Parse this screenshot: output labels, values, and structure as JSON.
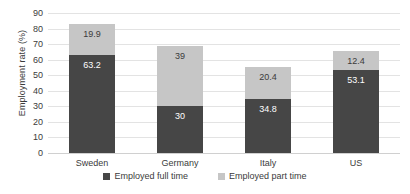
{
  "chart_data": {
    "type": "bar",
    "subtype": "stacked-bar",
    "title": "",
    "xlabel": "",
    "ylabel": "Employment rate (%)",
    "ylim": [
      0,
      90
    ],
    "ytick_step": 10,
    "yticks": [
      "90",
      "80",
      "70",
      "60",
      "50",
      "40",
      "30",
      "20",
      "10",
      "0"
    ],
    "grid": true,
    "legend_position": "bottom",
    "categories": [
      "Sweden",
      "Germany",
      "Italy",
      "US"
    ],
    "series": [
      {
        "name": "Employed full time",
        "color": "#464646",
        "values": [
          63.2,
          30,
          34.8,
          53.1
        ],
        "labels": [
          "63.2",
          "30",
          "34.8",
          "53.1"
        ]
      },
      {
        "name": "Employed part time",
        "color": "#c6c6c6",
        "values": [
          19.9,
          39,
          20.4,
          12.4
        ],
        "labels": [
          "19.9",
          "39",
          "20.4",
          "12.4"
        ]
      }
    ],
    "totals": [
      83.1,
      69,
      55.2,
      65.5
    ]
  },
  "legend": {
    "items": [
      {
        "label": "Employed full time",
        "color": "#464646"
      },
      {
        "label": "Employed part time",
        "color": "#c6c6c6"
      }
    ]
  },
  "colors": {
    "full_time": "#464646",
    "part_time": "#c6c6c6",
    "gridline": "#e3e3e3",
    "text": "#3b3b3b",
    "background": "#ffffff"
  }
}
